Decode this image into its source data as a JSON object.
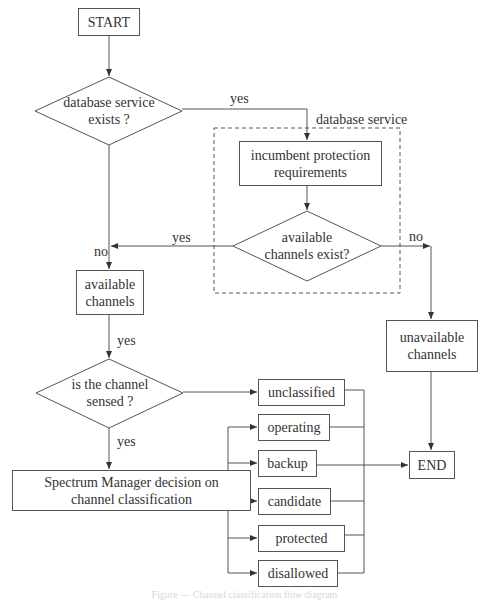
{
  "diagram": {
    "start": "START",
    "end": "END",
    "decision_db": {
      "line1": "database service",
      "line2": "exists ?"
    },
    "db_group_label": "database service",
    "incumbent": {
      "line1": "incumbent protection",
      "line2": "requirements"
    },
    "decision_avail": {
      "line1": "available",
      "line2": "channels exist?"
    },
    "available_channels": {
      "line1": "available",
      "line2": "channels"
    },
    "unavailable_channels": {
      "line1": "unavailable",
      "line2": "channels"
    },
    "decision_sensed": {
      "line1": "is the channel",
      "line2": "sensed ?"
    },
    "spectrum_manager": {
      "line1": "Spectrum Manager decision on",
      "line2": "channel classification"
    },
    "classes": [
      "unclassified",
      "operating",
      "backup",
      "candidate",
      "protected",
      "disallowed"
    ],
    "edge_labels": {
      "db_yes": "yes",
      "db_no": "no",
      "avail_yes": "yes",
      "avail_no": "no",
      "available_to_sensed_yes": "yes",
      "sensed_yes": "yes"
    },
    "caption": "Figure — Channel classification flow diagram"
  },
  "colors": {
    "line": "#555555",
    "text": "#333333",
    "background": "#ffffff"
  }
}
